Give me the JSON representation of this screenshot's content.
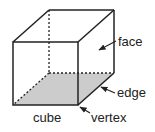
{
  "diagram": {
    "title": "cube",
    "labels": {
      "face": "face",
      "edge": "edge",
      "vertex": "vertex",
      "cube": "cube"
    },
    "colors": {
      "line": "#222222",
      "shaded_face": "#cccccc",
      "background": "#ffffff"
    }
  }
}
